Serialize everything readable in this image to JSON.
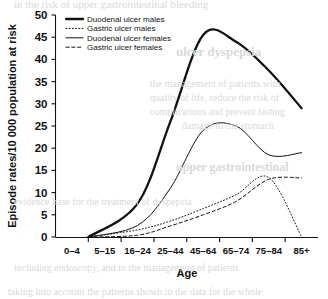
{
  "figure": {
    "background_color": "#ffffff",
    "ink_color": "#111111",
    "bleed_through_color": "#d9d9d9"
  },
  "chart_data": {
    "type": "line",
    "title": "",
    "xlabel": "Age",
    "ylabel": "Episode rates/10 000 population at risk",
    "categories": [
      "0–4",
      "5–15",
      "16–24",
      "25–44",
      "45–64",
      "65–74",
      "75–84",
      "85+"
    ],
    "ylim": [
      0,
      50
    ],
    "yticks": [
      0,
      5,
      10,
      15,
      20,
      25,
      30,
      35,
      40,
      45,
      50
    ],
    "ytick_labels": [
      "0",
      "5",
      "10",
      "15",
      "20",
      "25",
      "30",
      "35",
      "40",
      "45",
      "50"
    ],
    "grid": false,
    "legend_position": "top-left-inside",
    "series": [
      {
        "name": "Duodenal ulcer males",
        "style": "solid",
        "width": "thick",
        "values": [
          0,
          0,
          7.5,
          26.0,
          45.5,
          44.0,
          37.5,
          29.0
        ]
      },
      {
        "name": "Gastric ulcer males",
        "style": "dotted",
        "width": "thin",
        "values": [
          0,
          0,
          1.6,
          3.6,
          6.4,
          9.5,
          13.4,
          0.0
        ]
      },
      {
        "name": "Duodenal ulcer females",
        "style": "solid",
        "width": "thin",
        "values": [
          0,
          0,
          2.6,
          11.0,
          24.0,
          25.0,
          18.5,
          19.0
        ]
      },
      {
        "name": "Gastric ulcer females",
        "style": "dashed",
        "width": "thin",
        "values": [
          0,
          0,
          0.4,
          2.5,
          5.0,
          8.0,
          13.0,
          13.3
        ]
      }
    ]
  },
  "legend": {
    "entries": [
      {
        "label": "Duodenal ulcer males",
        "style": "solid-thick"
      },
      {
        "label": "Gastric ulcer males",
        "style": "dotted"
      },
      {
        "label": "Duodenal ulcer females",
        "style": "solid-thin"
      },
      {
        "label": "Gastric ulcer females",
        "style": "dashed"
      }
    ]
  },
  "page_bleed": {
    "top_line": "in the risk of upper gastrointestinal bleeding",
    "right_upper": "ulcer dyspepsia",
    "right_block_1": "the management of patients with",
    "right_block_2": "quality of life, reduce the risk of",
    "right_block_3": "complications and prevent lasting",
    "right_block_4": "damage to the stomach",
    "right_mid": "upper gastrointestinal",
    "lower_line_1": "evidence base for the treatment of dyspepsia",
    "lower_line_2": "including endoscopy, and to the management of patients",
    "bottom_line": "taking into account the patterns shown in the data for the whole"
  }
}
